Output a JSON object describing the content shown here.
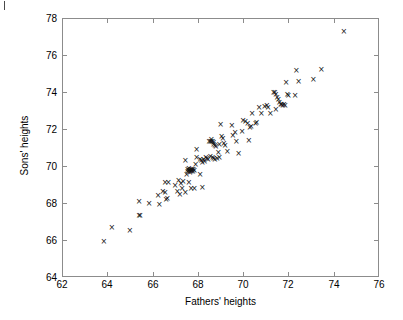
{
  "chart_data": {
    "type": "scatter",
    "title": "",
    "xlabel": "Fathers' heights",
    "ylabel": "Sons' heights",
    "xlim": [
      62,
      76
    ],
    "ylim": [
      64,
      78
    ],
    "xticks": [
      62,
      64,
      66,
      68,
      70,
      72,
      74,
      76
    ],
    "yticks": [
      64,
      66,
      68,
      70,
      72,
      74,
      76,
      78
    ],
    "xtick_labels": [
      "62",
      "64",
      "66",
      "68",
      "70",
      "72",
      "74",
      "76"
    ],
    "ytick_labels": [
      "64",
      "66",
      "68",
      "70",
      "72",
      "74",
      "76",
      "78"
    ],
    "grid": false,
    "legend": null,
    "marker": "x",
    "marker_color": "#111111",
    "frame_color": "#8c8c8c",
    "background": "#ffffff",
    "n_points": 121,
    "points": [
      [
        63.85,
        65.9
      ],
      [
        64.2,
        66.65
      ],
      [
        65.0,
        66.5
      ],
      [
        65.4,
        67.35
      ],
      [
        65.45,
        67.3
      ],
      [
        65.4,
        68.1
      ],
      [
        65.85,
        67.95
      ],
      [
        66.25,
        68.4
      ],
      [
        66.3,
        67.9
      ],
      [
        66.55,
        68.55
      ],
      [
        66.6,
        68.2
      ],
      [
        66.65,
        68.25
      ],
      [
        66.55,
        69.1
      ],
      [
        66.7,
        69.1
      ],
      [
        66.45,
        68.6
      ],
      [
        67.0,
        68.95
      ],
      [
        67.1,
        68.6
      ],
      [
        67.2,
        68.45
      ],
      [
        67.25,
        69.05
      ],
      [
        67.35,
        69.15
      ],
      [
        67.3,
        68.8
      ],
      [
        67.15,
        69.2
      ],
      [
        67.45,
        70.3
      ],
      [
        67.5,
        69.55
      ],
      [
        67.55,
        69.8
      ],
      [
        67.55,
        69.7
      ],
      [
        67.6,
        69.75
      ],
      [
        67.6,
        69.85
      ],
      [
        67.65,
        69.75
      ],
      [
        67.65,
        69.65
      ],
      [
        67.7,
        69.8
      ],
      [
        67.7,
        69.7
      ],
      [
        67.72,
        69.78
      ],
      [
        67.75,
        69.82
      ],
      [
        67.78,
        69.72
      ],
      [
        67.8,
        69.8
      ],
      [
        67.85,
        69.78
      ],
      [
        67.6,
        69.1
      ],
      [
        67.7,
        68.8
      ],
      [
        67.85,
        68.8
      ],
      [
        67.45,
        68.55
      ],
      [
        67.9,
        70.1
      ],
      [
        67.95,
        70.45
      ],
      [
        67.95,
        70.9
      ],
      [
        68.1,
        70.35
      ],
      [
        68.15,
        70.3
      ],
      [
        68.2,
        70.2
      ],
      [
        68.25,
        70.35
      ],
      [
        68.3,
        70.25
      ],
      [
        68.1,
        69.55
      ],
      [
        68.2,
        68.85
      ],
      [
        68.35,
        70.45
      ],
      [
        68.4,
        70.4
      ],
      [
        68.45,
        70.35
      ],
      [
        68.5,
        71.3
      ],
      [
        68.55,
        71.35
      ],
      [
        68.6,
        71.3
      ],
      [
        68.6,
        71.45
      ],
      [
        68.65,
        71.3
      ],
      [
        68.7,
        71.25
      ],
      [
        68.7,
        71.15
      ],
      [
        68.75,
        71.1
      ],
      [
        68.8,
        71.05
      ],
      [
        68.55,
        70.5
      ],
      [
        68.65,
        70.45
      ],
      [
        68.7,
        70.4
      ],
      [
        68.75,
        70.35
      ],
      [
        68.85,
        70.4
      ],
      [
        68.9,
        70.75
      ],
      [
        68.95,
        70.45
      ],
      [
        68.95,
        71.15
      ],
      [
        69.0,
        72.25
      ],
      [
        69.05,
        71.6
      ],
      [
        69.1,
        71.5
      ],
      [
        69.15,
        71.2
      ],
      [
        69.2,
        71.1
      ],
      [
        69.3,
        70.8
      ],
      [
        69.5,
        72.2
      ],
      [
        69.55,
        71.65
      ],
      [
        69.65,
        71.8
      ],
      [
        69.7,
        71.35
      ],
      [
        69.8,
        70.7
      ],
      [
        69.95,
        71.85
      ],
      [
        70.0,
        72.45
      ],
      [
        70.1,
        72.4
      ],
      [
        70.2,
        72.3
      ],
      [
        70.25,
        71.4
      ],
      [
        70.3,
        72.1
      ],
      [
        70.35,
        72.15
      ],
      [
        70.4,
        72.85
      ],
      [
        70.55,
        72.3
      ],
      [
        70.6,
        72.35
      ],
      [
        70.7,
        73.15
      ],
      [
        70.8,
        72.85
      ],
      [
        70.95,
        73.2
      ],
      [
        71.05,
        73.25
      ],
      [
        71.1,
        73.15
      ],
      [
        71.2,
        72.85
      ],
      [
        71.35,
        73.95
      ],
      [
        71.4,
        74.0
      ],
      [
        71.45,
        73.85
      ],
      [
        71.5,
        73.7
      ],
      [
        71.55,
        73.6
      ],
      [
        71.6,
        73.45
      ],
      [
        71.65,
        73.3
      ],
      [
        71.7,
        73.35
      ],
      [
        71.75,
        73.25
      ],
      [
        71.8,
        73.35
      ],
      [
        71.85,
        73.25
      ],
      [
        71.45,
        73.05
      ],
      [
        71.9,
        74.5
      ],
      [
        71.95,
        73.85
      ],
      [
        72.0,
        73.8
      ],
      [
        72.3,
        73.8
      ],
      [
        72.35,
        75.15
      ],
      [
        72.45,
        74.55
      ],
      [
        73.1,
        74.7
      ],
      [
        73.45,
        75.2
      ],
      [
        74.45,
        77.25
      ]
    ]
  }
}
